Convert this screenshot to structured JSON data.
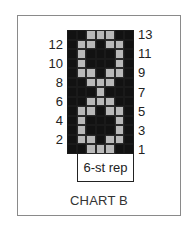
{
  "chart": {
    "title": "CHART B",
    "repeat_label": "6-st rep",
    "columns": 7,
    "rows": 13,
    "colors": {
      "dark": "#121212",
      "light": "#b9b9b9",
      "frame": "#8a8a8a"
    },
    "left_row_labels": [
      "12",
      "10",
      "8",
      "6",
      "4",
      "2"
    ],
    "right_row_labels": [
      "13",
      "11",
      "9",
      "7",
      "5",
      "3",
      "1"
    ]
  },
  "chart_data": {
    "type": "heatmap",
    "title": "CHART B",
    "annotation": "6-st rep",
    "legend": {
      "D": "dark (background color)",
      "L": "light (contrast color)"
    },
    "row_order": "top-to-bottom, row 13 to row 1",
    "rows": [
      {
        "row": 13,
        "cells": [
          "D",
          "D",
          "L",
          "L",
          "L",
          "D",
          "D"
        ]
      },
      {
        "row": 12,
        "cells": [
          "D",
          "L",
          "L",
          "D",
          "L",
          "L",
          "D"
        ]
      },
      {
        "row": 11,
        "cells": [
          "D",
          "L",
          "D",
          "D",
          "D",
          "L",
          "D"
        ]
      },
      {
        "row": 10,
        "cells": [
          "D",
          "L",
          "D",
          "D",
          "D",
          "L",
          "D"
        ]
      },
      {
        "row": 9,
        "cells": [
          "D",
          "L",
          "L",
          "D",
          "L",
          "L",
          "D"
        ]
      },
      {
        "row": 8,
        "cells": [
          "D",
          "D",
          "L",
          "L",
          "L",
          "D",
          "D"
        ]
      },
      {
        "row": 7,
        "cells": [
          "D",
          "D",
          "D",
          "L",
          "D",
          "D",
          "D"
        ]
      },
      {
        "row": 6,
        "cells": [
          "D",
          "D",
          "L",
          "L",
          "L",
          "D",
          "D"
        ]
      },
      {
        "row": 5,
        "cells": [
          "D",
          "L",
          "L",
          "D",
          "L",
          "L",
          "D"
        ]
      },
      {
        "row": 4,
        "cells": [
          "D",
          "L",
          "D",
          "D",
          "D",
          "L",
          "D"
        ]
      },
      {
        "row": 3,
        "cells": [
          "D",
          "L",
          "D",
          "D",
          "D",
          "L",
          "D"
        ]
      },
      {
        "row": 2,
        "cells": [
          "D",
          "L",
          "L",
          "D",
          "L",
          "L",
          "D"
        ]
      },
      {
        "row": 1,
        "cells": [
          "D",
          "D",
          "L",
          "L",
          "L",
          "D",
          "D"
        ]
      }
    ],
    "repeat_columns": [
      2,
      7
    ]
  }
}
